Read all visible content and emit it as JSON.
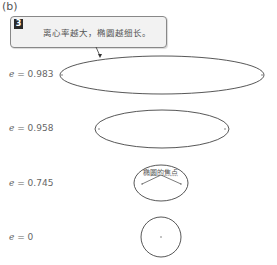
{
  "panel_label": "(b)",
  "callout": {
    "badge": "3",
    "text": "离心率越大，椭圆越细长。"
  },
  "ellipses": [
    {
      "e_symbol": "e",
      "eq": " = ",
      "value": "0.983",
      "cx": 162,
      "cy": 75,
      "rx": 102,
      "ry": 19
    },
    {
      "e_symbol": "e",
      "eq": " = ",
      "value": "0.958",
      "cx": 162,
      "cy": 129,
      "rx": 67,
      "ry": 19
    },
    {
      "e_symbol": "e",
      "eq": " = ",
      "value": "0.745",
      "cx": 161,
      "cy": 183,
      "rx": 27,
      "ry": 18
    },
    {
      "e_symbol": "e",
      "eq": " = ",
      "value": "0",
      "cx": 161,
      "cy": 237,
      "rx": 20,
      "ry": 20
    }
  ],
  "foci_label": "椭圆的焦点",
  "colors": {
    "stroke": "#444444",
    "callout_bg": "#f2f2f2",
    "badge_bg": "#2a2a2a"
  }
}
